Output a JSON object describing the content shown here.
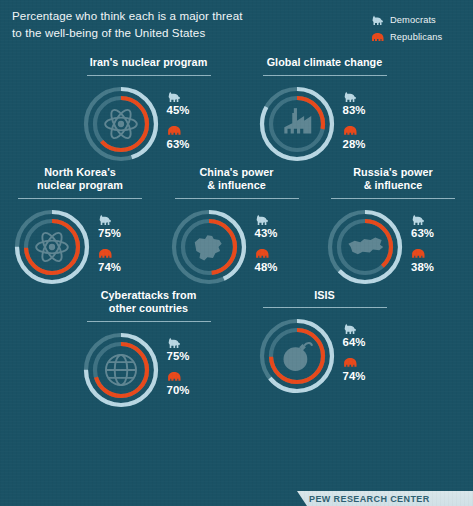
{
  "header": {
    "headline": "Percentage who think each is a major threat to the well-being of the United States",
    "headline_line1": "Percentage who think each is a major threat",
    "headline_line2": "to the well-being of the United States"
  },
  "legend": {
    "items": [
      {
        "label": "Democrats",
        "icon": "donkey-icon",
        "color": "#b9d7e3"
      },
      {
        "label": "Republicans",
        "icon": "elephant-icon",
        "color": "#e8491b"
      }
    ]
  },
  "colors": {
    "background": "#1a5265",
    "democrat": "#b9d7e3",
    "republican": "#e8491b",
    "track_outer": "#7fa8b6",
    "track_inner": "#5e8c9c",
    "rule": "#b8d4de",
    "text": "#ffffff"
  },
  "footer": {
    "banner_text": "PEW RESEARCH CENTER"
  },
  "chart_data": {
    "type": "pie",
    "title": "Percentage who think each is a major threat to the well-being of the United States",
    "subtitle": "",
    "xlabel": "",
    "ylabel": "",
    "legend_position": "top-right",
    "units": "%",
    "value_range": [
      0,
      100
    ],
    "series": [
      {
        "name": "Democrats",
        "color": "#b9d7e3",
        "values": [
          45,
          83,
          75,
          43,
          63,
          75,
          64
        ]
      },
      {
        "name": "Republicans",
        "color": "#e8491b",
        "values": [
          63,
          28,
          74,
          48,
          38,
          70,
          74
        ]
      }
    ],
    "categories": [
      "Iran's nuclear program",
      "Global climate change",
      "North Korea's nuclear program",
      "China's power & influence",
      "Russia's power & influence",
      "Cyberattacks from other countries",
      "ISIS"
    ]
  },
  "rows": [
    {
      "cards": [
        {
          "title_line1": "Iran's nuclear program",
          "title_line2": "",
          "icon": "atom-icon",
          "dem": {
            "value": 45,
            "label": "45%",
            "icon": "donkey-icon"
          },
          "rep": {
            "value": 63,
            "label": "63%",
            "icon": "elephant-icon"
          }
        },
        {
          "title_line1": "Global climate change",
          "title_line2": "",
          "icon": "factory-icon",
          "dem": {
            "value": 83,
            "label": "83%",
            "icon": "donkey-icon"
          },
          "rep": {
            "value": 28,
            "label": "28%",
            "icon": "elephant-icon"
          }
        }
      ]
    },
    {
      "cards": [
        {
          "title_line1": "North Korea's",
          "title_line2": "nuclear program",
          "icon": "atom-icon",
          "dem": {
            "value": 75,
            "label": "75%",
            "icon": "donkey-icon"
          },
          "rep": {
            "value": 74,
            "label": "74%",
            "icon": "elephant-icon"
          }
        },
        {
          "title_line1": "China's power",
          "title_line2": "& influence",
          "icon": "china-map-icon",
          "dem": {
            "value": 43,
            "label": "43%",
            "icon": "donkey-icon"
          },
          "rep": {
            "value": 48,
            "label": "48%",
            "icon": "elephant-icon"
          }
        },
        {
          "title_line1": "Russia's power",
          "title_line2": "& influence",
          "icon": "russia-map-icon",
          "dem": {
            "value": 63,
            "label": "63%",
            "icon": "donkey-icon"
          },
          "rep": {
            "value": 38,
            "label": "38%",
            "icon": "elephant-icon"
          }
        }
      ]
    },
    {
      "cards": [
        {
          "title_line1": "Cyberattacks from",
          "title_line2": "other countries",
          "icon": "globe-icon",
          "dem": {
            "value": 75,
            "label": "75%",
            "icon": "donkey-icon"
          },
          "rep": {
            "value": 70,
            "label": "70%",
            "icon": "elephant-icon"
          }
        },
        {
          "title_line1": "ISIS",
          "title_line2": "",
          "icon": "bomb-icon",
          "dem": {
            "value": 64,
            "label": "64%",
            "icon": "donkey-icon"
          },
          "rep": {
            "value": 74,
            "label": "74%",
            "icon": "elephant-icon"
          }
        }
      ]
    }
  ]
}
